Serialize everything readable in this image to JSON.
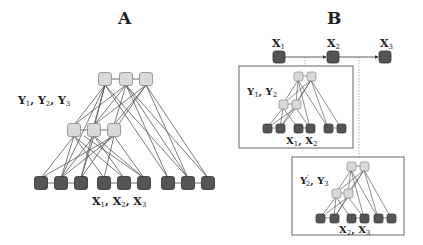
{
  "panels": {
    "A": {
      "title": "A",
      "hidden_label": {
        "main": "Y",
        "subs": [
          "1",
          "2",
          "3"
        ],
        "text": "Y1, Y2, Y3"
      },
      "observed_label": {
        "main": "X",
        "subs": [
          "1",
          "2",
          "3"
        ],
        "text": "X1, X2, X3"
      }
    },
    "B": {
      "title": "B",
      "chain": [
        {
          "label": "X",
          "sub": "1"
        },
        {
          "label": "X",
          "sub": "2"
        },
        {
          "label": "X",
          "sub": "3"
        }
      ],
      "box1": {
        "hidden_label": "Y1, Y2",
        "observed_label": "X1, X2"
      },
      "box2": {
        "hidden_label": "Y'2, Y3",
        "observed_label": "X2, X3"
      }
    }
  },
  "colors": {
    "hidden_node": "#d9d9d9",
    "observed_node": "#555555",
    "edge": "#444444",
    "box_border": "#666666"
  }
}
